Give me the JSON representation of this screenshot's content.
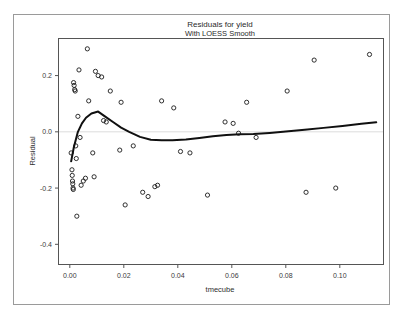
{
  "chart_data": {
    "type": "scatter",
    "title": "Residuals for yield",
    "subtitle": "With LOESS Smooth",
    "xlabel": "tmecube",
    "ylabel": "Residual",
    "xlim": [
      -0.004,
      0.116
    ],
    "ylim": [
      -0.47,
      0.33
    ],
    "grid": false,
    "legend": null,
    "xticks": [
      "0.00",
      "0.02",
      "0.04",
      "0.06",
      "0.08",
      "0.10"
    ],
    "xtick_values": [
      0.0,
      0.02,
      0.04,
      0.06,
      0.08,
      0.1
    ],
    "yticks": [
      "0.2",
      "0.0",
      "-0.2",
      "-0.4"
    ],
    "ytick_values": [
      0.2,
      0.0,
      -0.2,
      -0.4
    ],
    "reference_line_y": 0.0,
    "marker": "open-circle",
    "points": [
      {
        "x": 0.0005,
        "y": -0.075
      },
      {
        "x": 0.0008,
        "y": -0.135
      },
      {
        "x": 0.0009,
        "y": -0.155
      },
      {
        "x": 0.001,
        "y": -0.175
      },
      {
        "x": 0.0011,
        "y": -0.185
      },
      {
        "x": 0.0012,
        "y": -0.2
      },
      {
        "x": 0.0013,
        "y": -0.205
      },
      {
        "x": 0.0014,
        "y": 0.175
      },
      {
        "x": 0.0016,
        "y": 0.165
      },
      {
        "x": 0.0018,
        "y": 0.15
      },
      {
        "x": 0.002,
        "y": 0.145
      },
      {
        "x": 0.0022,
        "y": -0.05
      },
      {
        "x": 0.0024,
        "y": -0.095
      },
      {
        "x": 0.0026,
        "y": -0.3
      },
      {
        "x": 0.003,
        "y": 0.055
      },
      {
        "x": 0.0034,
        "y": 0.22
      },
      {
        "x": 0.0038,
        "y": -0.02
      },
      {
        "x": 0.0042,
        "y": -0.19
      },
      {
        "x": 0.005,
        "y": -0.175
      },
      {
        "x": 0.0058,
        "y": -0.165
      },
      {
        "x": 0.0065,
        "y": 0.295
      },
      {
        "x": 0.007,
        "y": 0.11
      },
      {
        "x": 0.0085,
        "y": -0.075
      },
      {
        "x": 0.009,
        "y": -0.16
      },
      {
        "x": 0.0095,
        "y": 0.215
      },
      {
        "x": 0.0105,
        "y": 0.2
      },
      {
        "x": 0.0118,
        "y": 0.195
      },
      {
        "x": 0.0125,
        "y": 0.04
      },
      {
        "x": 0.0135,
        "y": 0.035
      },
      {
        "x": 0.015,
        "y": 0.145
      },
      {
        "x": 0.0185,
        "y": -0.065
      },
      {
        "x": 0.019,
        "y": 0.105
      },
      {
        "x": 0.0205,
        "y": -0.26
      },
      {
        "x": 0.0235,
        "y": -0.05
      },
      {
        "x": 0.027,
        "y": -0.215
      },
      {
        "x": 0.029,
        "y": -0.23
      },
      {
        "x": 0.0315,
        "y": -0.195
      },
      {
        "x": 0.0325,
        "y": -0.19
      },
      {
        "x": 0.034,
        "y": 0.11
      },
      {
        "x": 0.0385,
        "y": 0.085
      },
      {
        "x": 0.041,
        "y": -0.07
      },
      {
        "x": 0.0445,
        "y": -0.075
      },
      {
        "x": 0.051,
        "y": -0.225
      },
      {
        "x": 0.0575,
        "y": 0.035
      },
      {
        "x": 0.0605,
        "y": 0.03
      },
      {
        "x": 0.0625,
        "y": -0.005
      },
      {
        "x": 0.0655,
        "y": 0.105
      },
      {
        "x": 0.069,
        "y": -0.02
      },
      {
        "x": 0.0805,
        "y": 0.145
      },
      {
        "x": 0.0875,
        "y": -0.215
      },
      {
        "x": 0.0905,
        "y": 0.255
      },
      {
        "x": 0.0985,
        "y": -0.2
      },
      {
        "x": 0.111,
        "y": 0.275
      }
    ],
    "loess": [
      {
        "x": 0.0005,
        "y": -0.105
      },
      {
        "x": 0.0015,
        "y": -0.055
      },
      {
        "x": 0.003,
        "y": 0.0
      },
      {
        "x": 0.0045,
        "y": 0.03
      },
      {
        "x": 0.006,
        "y": 0.05
      },
      {
        "x": 0.008,
        "y": 0.065
      },
      {
        "x": 0.0105,
        "y": 0.072
      },
      {
        "x": 0.013,
        "y": 0.055
      },
      {
        "x": 0.016,
        "y": 0.035
      },
      {
        "x": 0.019,
        "y": 0.015
      },
      {
        "x": 0.022,
        "y": 0.0
      },
      {
        "x": 0.026,
        "y": -0.018
      },
      {
        "x": 0.03,
        "y": -0.028
      },
      {
        "x": 0.034,
        "y": -0.03
      },
      {
        "x": 0.038,
        "y": -0.03
      },
      {
        "x": 0.043,
        "y": -0.027
      },
      {
        "x": 0.048,
        "y": -0.022
      },
      {
        "x": 0.053,
        "y": -0.016
      },
      {
        "x": 0.058,
        "y": -0.011
      },
      {
        "x": 0.063,
        "y": -0.009
      },
      {
        "x": 0.068,
        "y": -0.008
      },
      {
        "x": 0.074,
        "y": -0.004
      },
      {
        "x": 0.08,
        "y": 0.001
      },
      {
        "x": 0.087,
        "y": 0.007
      },
      {
        "x": 0.094,
        "y": 0.014
      },
      {
        "x": 0.101,
        "y": 0.021
      },
      {
        "x": 0.108,
        "y": 0.029
      },
      {
        "x": 0.1135,
        "y": 0.034
      }
    ]
  },
  "colors": {
    "marker_stroke": "#1a1a1a",
    "loess_stroke": "#101010",
    "axis": "#555555",
    "frame": "#9a9a9a",
    "reference_line": "#dcdcdc",
    "background": "#ffffff"
  }
}
